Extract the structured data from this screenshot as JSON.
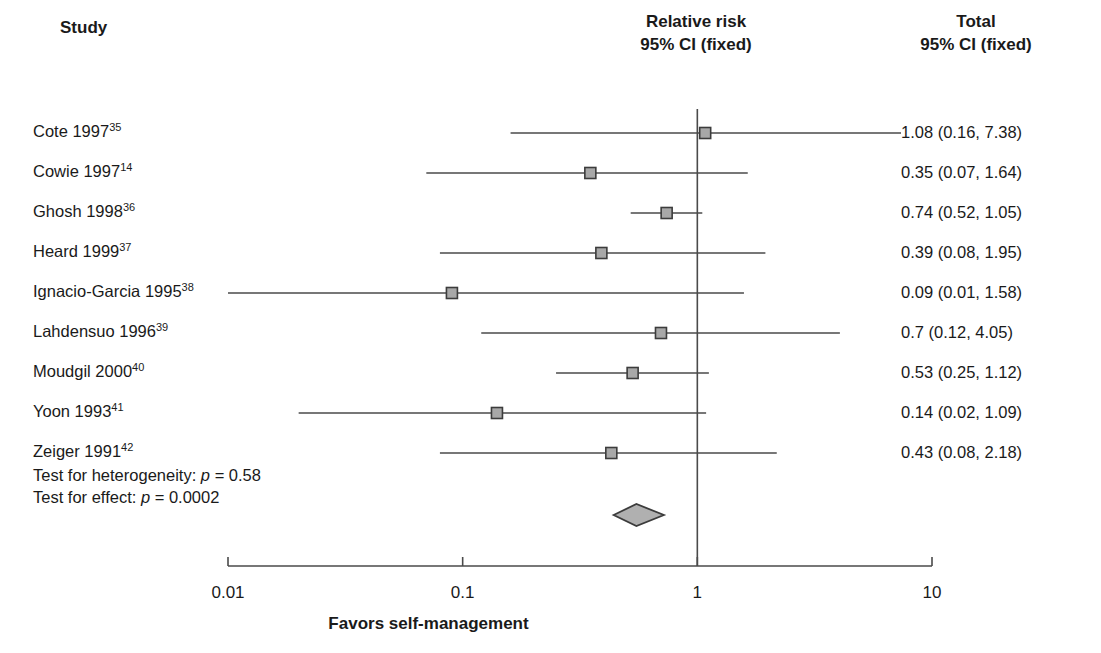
{
  "headers": {
    "study": "Study",
    "center_line1": "Relative risk",
    "center_line2": "95% CI (fixed)",
    "right_line1": "Total",
    "right_line2": "95% CI (fixed)"
  },
  "tests": {
    "heterogeneity_prefix": "Test for heterogeneity: ",
    "heterogeneity_p": "p",
    "heterogeneity_value": " = 0.58",
    "effect_prefix": "Test for effect: ",
    "effect_p": "p",
    "effect_value": " = 0.0002"
  },
  "axis": {
    "title": "Favors self-management",
    "ticks": [
      "0.01",
      "0.1",
      "1",
      "10"
    ],
    "tick_values": [
      0.01,
      0.1,
      1,
      10
    ],
    "scale": "log",
    "null_value": 1
  },
  "colors": {
    "marker_fill": "#a8a8a8",
    "marker_border": "#3c3c3c",
    "line": "#4a4a4a",
    "diamond_fill": "#b0b0b0",
    "diamond_border": "#3c3c3c",
    "text": "#1a1a1a"
  },
  "chart_data": {
    "type": "forest",
    "title": "Relative risk 95% CI (fixed)",
    "xlabel": "Favors self-management",
    "ylabel": "Study",
    "xscale": "log",
    "xlim": [
      0.01,
      10
    ],
    "xticks": [
      0.01,
      0.1,
      1,
      10
    ],
    "xticklabels": [
      "0.01",
      "0.1",
      "1",
      "10"
    ],
    "grid": false,
    "reference_line": 1,
    "effect_measure": "Relative risk",
    "model": "fixed",
    "studies": [
      {
        "label": "Cote 1997",
        "ref": "35",
        "rr": 1.08,
        "ci_low": 0.16,
        "ci_high": 7.38,
        "display": "1.08 (0.16, 7.38)"
      },
      {
        "label": "Cowie 1997",
        "ref": "14",
        "rr": 0.35,
        "ci_low": 0.07,
        "ci_high": 1.64,
        "display": "0.35 (0.07, 1.64)"
      },
      {
        "label": "Ghosh 1998",
        "ref": "36",
        "rr": 0.74,
        "ci_low": 0.52,
        "ci_high": 1.05,
        "display": "0.74 (0.52, 1.05)"
      },
      {
        "label": "Heard 1999",
        "ref": "37",
        "rr": 0.39,
        "ci_low": 0.08,
        "ci_high": 1.95,
        "display": "0.39 (0.08, 1.95)"
      },
      {
        "label": "Ignacio-Garcia 1995",
        "ref": "38",
        "rr": 0.09,
        "ci_low": 0.01,
        "ci_high": 1.58,
        "display": "0.09 (0.01, 1.58)"
      },
      {
        "label": "Lahdensuo 1996",
        "ref": "39",
        "rr": 0.7,
        "ci_low": 0.12,
        "ci_high": 4.05,
        "display": "0.7 (0.12, 4.05)"
      },
      {
        "label": "Moudgil 2000",
        "ref": "40",
        "rr": 0.53,
        "ci_low": 0.25,
        "ci_high": 1.12,
        "display": "0.53 (0.25, 1.12)"
      },
      {
        "label": "Yoon 1993",
        "ref": "41",
        "rr": 0.14,
        "ci_low": 0.02,
        "ci_high": 1.09,
        "display": "0.14 (0.02, 1.09)"
      },
      {
        "label": "Zeiger 1991",
        "ref": "42",
        "rr": 0.43,
        "ci_low": 0.08,
        "ci_high": 2.18,
        "display": "0.43 (0.08, 2.18)"
      }
    ],
    "summary": {
      "label": "Total",
      "rr": 0.55,
      "ci_low": 0.44,
      "ci_high": 0.72,
      "shape": "diamond"
    }
  }
}
